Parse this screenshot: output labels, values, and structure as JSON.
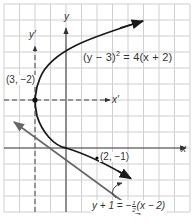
{
  "figure": {
    "type": "parabola-graph",
    "axes": {
      "x_label": "x",
      "y_label": "y",
      "x_prime_label": "x′",
      "y_prime_label": "y′"
    },
    "curve": {
      "equation_lhs": "(y − 3)",
      "equation_exp": "2",
      "equation_rhs": "= 4(x + 2)"
    },
    "points": {
      "vertex_label": "(3, −2)",
      "tangent_point_label": "(2, −1)"
    },
    "tangent": {
      "eq_left": "y + 1 = −",
      "frac_num": "1",
      "frac_den": "2",
      "eq_right": "(x − 2)"
    },
    "colors": {
      "grid": "#cfcfcf",
      "axis": "#444444",
      "curve": "#1a1a1a",
      "tangent": "#555555",
      "text": "#333333"
    }
  }
}
